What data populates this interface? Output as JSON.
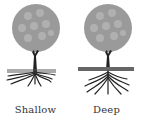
{
  "diagram": {
    "trees": [
      {
        "label": "Shallow",
        "root_type": "shallow",
        "ground": "lines"
      },
      {
        "label": "Deep",
        "root_type": "deep",
        "ground": "bar"
      }
    ],
    "colors": {
      "canopy": "#9a9a9a",
      "canopy_highlight": "#b4b4b4",
      "trunk": "#222222",
      "ground": "#555555",
      "label": "#333333"
    }
  }
}
